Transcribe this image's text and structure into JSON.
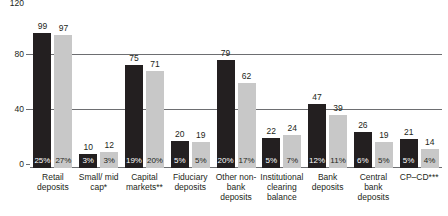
{
  "chart_data": {
    "type": "bar",
    "title": "",
    "xlabel": "",
    "ylabel": "",
    "ylim": [
      0,
      120
    ],
    "yticks": [
      "0",
      "40",
      "80",
      "120"
    ],
    "grid": true,
    "legend_position": "none",
    "categories": [
      "Retail deposits",
      "Small/ mid cap*",
      "Capital markets**",
      "Fiduciary deposits",
      "Other non-bank deposits",
      "Institutional clearing balance",
      "Bank deposits",
      "Central bank deposits",
      "CP–CD***"
    ],
    "series": [
      {
        "name": "dark",
        "color": "#231f20",
        "values": [
          99,
          10,
          75,
          20,
          79,
          22,
          47,
          26,
          21
        ],
        "percent_labels": [
          "25%",
          "3%",
          "19%",
          "5%",
          "20%",
          "5%",
          "12%",
          "6%",
          "5%"
        ]
      },
      {
        "name": "light",
        "color": "#c8c8c8",
        "values": [
          97,
          12,
          71,
          19,
          62,
          24,
          39,
          19,
          14
        ],
        "percent_labels": [
          "27%",
          "3%",
          "20%",
          "5%",
          "17%",
          "7%",
          "11%",
          "5%",
          "4%"
        ]
      }
    ]
  }
}
